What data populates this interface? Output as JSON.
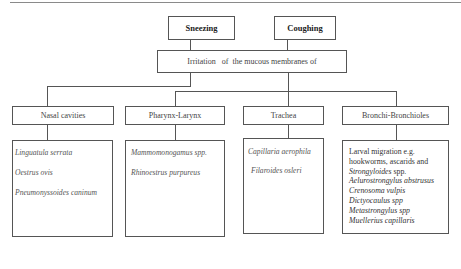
{
  "diagram": {
    "symptoms": [
      {
        "label": "Sneezing"
      },
      {
        "label": "Coughing"
      }
    ],
    "cause": {
      "label": "Irritation   of  the mucous membranes of"
    },
    "sites": [
      {
        "label": "Nasal cavities",
        "parasites": [
          "Linguatula serrata",
          "Oestrus ovis",
          "Pneumonyssoides caninum"
        ]
      },
      {
        "label": "Pharynx-Larynx",
        "parasites": [
          "Mammomonogamus spp.",
          "Rhinoestrus purpureus"
        ]
      },
      {
        "label": "Trachea",
        "parasites": [
          "Capillaria aerophila",
          "Filaroides osleri"
        ]
      },
      {
        "label": "Bronchi-Bronchioles",
        "intro": [
          "Larval migration e.g.",
          "hookworms, ascarids and"
        ],
        "strongyloides": {
          "genus": "Strongyloides",
          "suffix": " spp."
        },
        "parasites": [
          "Aelurostrongylus abstrusus",
          "Crenosoma vulpis",
          "Dictyocaulus spp",
          "Metastrongylus spp",
          "Muellerius capillaris"
        ]
      }
    ]
  },
  "colors": {
    "line": "#555555",
    "background": "#ffffff"
  }
}
